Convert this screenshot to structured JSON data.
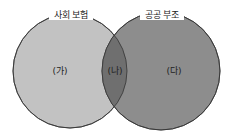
{
  "diagram": {
    "type": "venn",
    "sets": [
      {
        "name": "사회 보험",
        "color": "#c2c2c2"
      },
      {
        "name": "공공 부조",
        "color": "#8d8d8d"
      }
    ],
    "intersection_color": "#6f6f6f",
    "regions": [
      {
        "label": "(가)",
        "position": "left-only"
      },
      {
        "label": "(나)",
        "position": "intersection"
      },
      {
        "label": "(다)",
        "position": "right-only"
      }
    ]
  }
}
